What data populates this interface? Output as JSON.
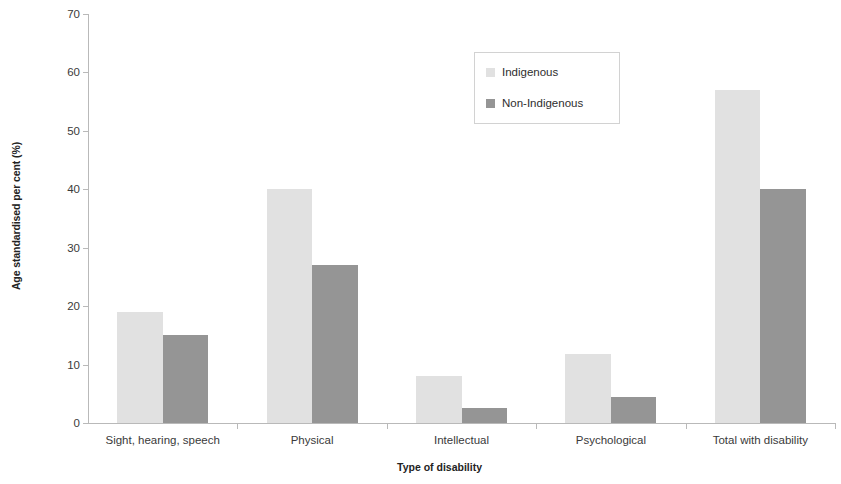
{
  "chart_data": {
    "type": "bar",
    "title": "",
    "xlabel": "Type of disability",
    "ylabel": "Age standardised per cent (%)",
    "categories": [
      "Sight, hearing, speech",
      "Physical",
      "Intellectual",
      "Psychological",
      "Total with disability"
    ],
    "series": [
      {
        "name": "Indigenous",
        "color": "#e1e1e1",
        "values": [
          19,
          40,
          8,
          11.8,
          57
        ]
      },
      {
        "name": "Non-Indigenous",
        "color": "#959595",
        "values": [
          15,
          27,
          2.5,
          4.5,
          40
        ]
      }
    ],
    "ylim": [
      0,
      70
    ],
    "yticks": [
      0,
      10,
      20,
      30,
      40,
      50,
      60,
      70
    ],
    "ytick_labels": [
      "0",
      "10",
      "20",
      "30",
      "40",
      "50",
      "60",
      "70"
    ],
    "grid": false,
    "legend_position": "upper center",
    "axis_color": "#b9b9b9"
  }
}
